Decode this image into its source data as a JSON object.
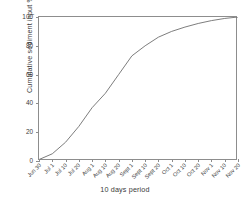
{
  "chart_data": {
    "type": "line",
    "title": "",
    "xlabel": "10 days period",
    "ylabel": "Cumulative sediment input %",
    "xlim": [
      0,
      15
    ],
    "ylim": [
      0,
      100
    ],
    "grid": false,
    "legend": null,
    "yticks": [
      0,
      20,
      40,
      60,
      80,
      100
    ],
    "ytick_labels": [
      "0",
      "20",
      "40",
      "60",
      "80",
      "100"
    ],
    "categories": [
      "Jun 30",
      "Jul 1",
      "Jul 10",
      "Jul 20",
      "Aug 1",
      "Aug 10",
      "Aug 20",
      "Sept 1",
      "Sept 10",
      "Sept 20",
      "Oct 1",
      "Oct 10",
      "Oct 20",
      "Nov 1",
      "Nov 10",
      "Nov 20"
    ],
    "series": [
      {
        "name": "Cumulative sediment input",
        "color": "#6e6e6e",
        "values": [
          1,
          5,
          13,
          24,
          37,
          47,
          60,
          73,
          80,
          86,
          90,
          93,
          95.5,
          97.5,
          99,
          100
        ]
      }
    ]
  }
}
